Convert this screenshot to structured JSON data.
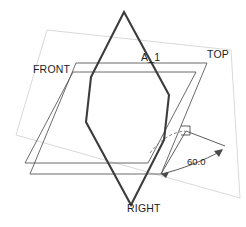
{
  "diagram": {
    "type": "engineering-projection",
    "background_color": "#ffffff",
    "labels": {
      "top_plane": "TOP",
      "front_plane": "FRONT",
      "right_plane": "RIGHT",
      "auxiliary_plane": "A_1",
      "angle_dimension": "60.0"
    },
    "colors": {
      "faint_plane": "#c9c9c9",
      "thin_plane": "#5a5a5a",
      "bold_plane": "#3c3c3c",
      "dashed_arc": "#6e6e6e",
      "dimension": "#4a4a4a",
      "text": "#1d1d1d"
    },
    "geometry": {
      "top_plane_outline": "47,30 231,50 240,198 16,135",
      "front_plane_outline": "76,63 207,63 161,174 30,174",
      "right_plane_outline": "73,72 196,72 148,163 25,163",
      "auxiliary_plane_outline": "124,12 169,95 164,140 131,205 86,122 91,77",
      "rotation_arc_path": "M 150,153 C 160,140 172,132 185,131",
      "right_angle_marker": "181,126 190,126 190,135 181,135",
      "angle_arc_path": "M 161,174 C 180,170 205,160 221,151",
      "angle_leader_upper": "M 186,131 L 225,146",
      "angle_leader_lower": "M 186,131 L 161,174",
      "arrow_left": "161,174 169,172 166,178",
      "arrow_right": "223,149 214,151 219,157"
    },
    "annotations": [
      {
        "name": "top-plane-label",
        "text": "TOP",
        "x": 207,
        "y": 58
      },
      {
        "name": "front-plane-label",
        "text": "FRONT",
        "x": 33,
        "y": 73
      },
      {
        "name": "right-plane-label",
        "text": "RIGHT",
        "x": 127,
        "y": 212
      },
      {
        "name": "auxiliary-plane-label",
        "text": "A_1",
        "x": 141,
        "y": 61
      },
      {
        "name": "angle-dimension-label",
        "text": "60.0",
        "x": 187,
        "y": 165
      }
    ]
  }
}
